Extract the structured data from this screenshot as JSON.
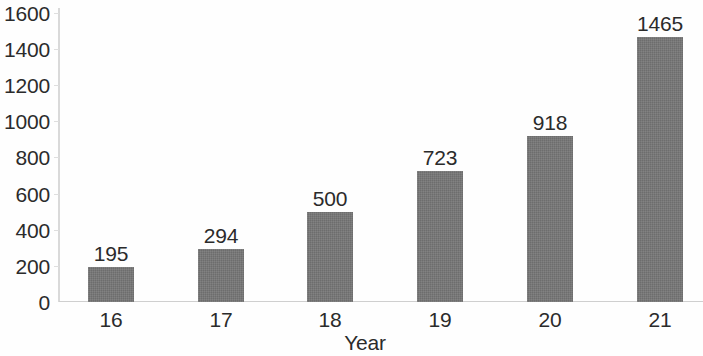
{
  "chart_data": {
    "type": "bar",
    "title": "",
    "subtitle": "",
    "xlabel": "Year",
    "ylabel": "",
    "categories": [
      "16",
      "17",
      "18",
      "19",
      "20",
      "21"
    ],
    "values": [
      195,
      294,
      500,
      723,
      918,
      1465
    ],
    "data_labels": [
      "195",
      "294",
      "500",
      "723",
      "918",
      "1465"
    ],
    "ylim": [
      0,
      1600
    ],
    "ytick_step": 200,
    "ytick_labels": [
      "1600",
      "1400",
      "1200",
      "1000",
      "800",
      "600",
      "400",
      "200",
      "0"
    ],
    "ytick_values": [
      1600,
      1400,
      1200,
      1000,
      800,
      600,
      400,
      200,
      0
    ],
    "grid": false,
    "legend": null,
    "series": [
      {
        "name": "",
        "values": [
          195,
          294,
          500,
          723,
          918,
          1465
        ]
      }
    ],
    "colors": {
      "bar": "#757575",
      "text": "#2b2b2b",
      "axis": "#d4d4d4",
      "background": "#fefefe"
    }
  }
}
